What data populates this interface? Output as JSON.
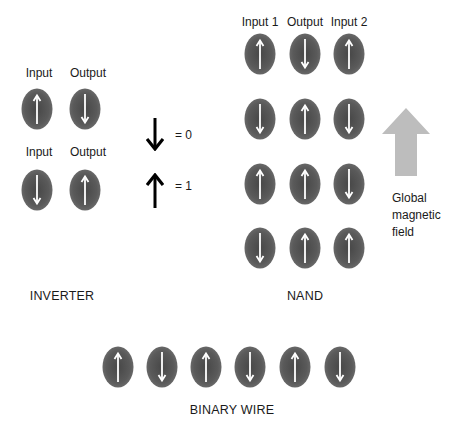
{
  "colors": {
    "magnet_fill": "#5a5a5a",
    "magnet_center": "#4a4a4a",
    "magnet_edge": "#6c6c6c",
    "magnet_arrow": "#ffffff",
    "legend_arrow": "#000000",
    "field_arrow": "#bcbcbc",
    "text": "#1a1a1a"
  },
  "inverter": {
    "title": "INVERTER",
    "rows": [
      {
        "labels": [
          "Input",
          "Output"
        ],
        "spins": [
          "up",
          "down"
        ]
      },
      {
        "labels": [
          "Input",
          "Output"
        ],
        "spins": [
          "down",
          "up"
        ]
      }
    ]
  },
  "legend": {
    "items": [
      {
        "arrow": "down",
        "text": "= 0"
      },
      {
        "arrow": "up",
        "text": "= 1"
      }
    ]
  },
  "nand": {
    "title": "NAND",
    "column_labels": [
      "Input 1",
      "Output",
      "Input 2"
    ],
    "rows": [
      [
        "up",
        "down",
        "up"
      ],
      [
        "down",
        "up",
        "down"
      ],
      [
        "up",
        "up",
        "down"
      ],
      [
        "down",
        "up",
        "up"
      ]
    ]
  },
  "global_field": {
    "arrow": "up",
    "lines": [
      "Global",
      "magnetic",
      "field"
    ]
  },
  "binary_wire": {
    "title": "BINARY WIRE",
    "spins": [
      "up",
      "down",
      "up",
      "down",
      "up",
      "down"
    ]
  }
}
